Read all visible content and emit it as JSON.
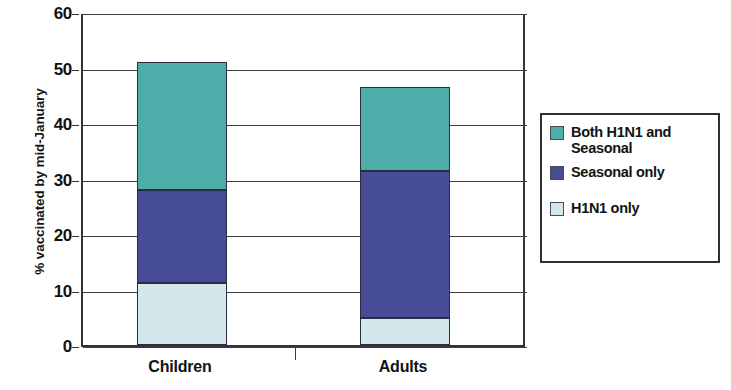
{
  "chart_data": {
    "type": "bar",
    "subtype": "stacked-bar",
    "title": "",
    "xlabel": "",
    "ylabel": "% vaccinated by mid-January",
    "ylim": [
      0,
      60
    ],
    "yticks": [
      0,
      10,
      20,
      30,
      40,
      50,
      60
    ],
    "ytick_labels": [
      "0",
      "10",
      "20",
      "30",
      "40",
      "50",
      "60"
    ],
    "grid": true,
    "grid_axis": "y",
    "legend_position": "right",
    "categories": [
      "Children",
      "Adults"
    ],
    "series": [
      {
        "name": "H1N1 only",
        "color": "#d4e8ec",
        "values": [
          11.2,
          4.9
        ]
      },
      {
        "name": "Seasonal only",
        "color": "#474c97",
        "values": [
          16.8,
          26.5
        ]
      },
      {
        "name": "Both H1N1 and Seasonal",
        "color": "#4dada8",
        "values": [
          23.0,
          15.1
        ]
      }
    ],
    "stack_order_bottom_to_top": [
      "H1N1 only",
      "Seasonal only",
      "Both H1N1 and Seasonal"
    ],
    "totals": [
      51.0,
      46.5
    ],
    "cumulative_tops": {
      "Children": [
        11.2,
        28.0,
        51.0
      ],
      "Adults": [
        4.9,
        31.4,
        46.5
      ]
    }
  },
  "axes": {
    "y_title": "% vaccinated by mid-January",
    "ticks": [
      {
        "label": "60",
        "value": 60
      },
      {
        "label": "50",
        "value": 50
      },
      {
        "label": "40",
        "value": 40
      },
      {
        "label": "30",
        "value": 30
      },
      {
        "label": "20",
        "value": 20
      },
      {
        "label": "10",
        "value": 10
      },
      {
        "label": "0",
        "value": 0
      }
    ],
    "categories": [
      {
        "label": "Children"
      },
      {
        "label": "Adults"
      }
    ]
  },
  "legend": {
    "entries": [
      {
        "label": "Both H1N1 and Seasonal",
        "color": "#4dada8"
      },
      {
        "label": "Seasonal only",
        "color": "#474c97"
      },
      {
        "label": "H1N1 only",
        "color": "#d4e8ec"
      }
    ]
  },
  "colors": {
    "both": "#4dada8",
    "seasonal_only": "#474c97",
    "h1n1_only": "#d4e8ec",
    "axis": "#333333",
    "text": "#121212"
  }
}
